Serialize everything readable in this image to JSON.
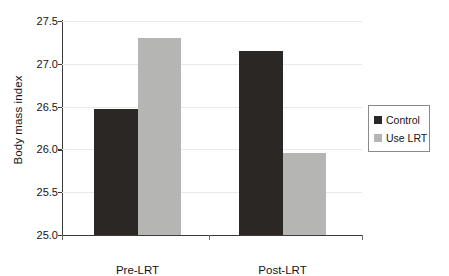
{
  "chart_data": {
    "type": "bar",
    "title": "",
    "subtitle": "",
    "xlabel": "",
    "ylabel": "Body mass index",
    "categories": [
      "Pre-LRT",
      "Post-LRT"
    ],
    "series": [
      {
        "name": "Control",
        "color": "#2b2724",
        "values": [
          26.47,
          27.15
        ]
      },
      {
        "name": "Use LRT",
        "color": "#b5b5b3",
        "values": [
          27.3,
          25.96
        ]
      }
    ],
    "ylim": [
      25.0,
      27.5
    ],
    "yticks": [
      "25.0",
      "25.5",
      "26.0",
      "26.5",
      "27.0",
      "27.5"
    ],
    "ytick_values": [
      25.0,
      25.5,
      26.0,
      26.5,
      27.0,
      27.5
    ],
    "grid": true,
    "grid_axis": "y",
    "legend": {
      "position": "right",
      "entries": [
        "Control",
        "Use LRT"
      ]
    },
    "background": "#ffffff",
    "axis_color": "#3a3a3a",
    "gridline_color": "#e9e9e9"
  }
}
